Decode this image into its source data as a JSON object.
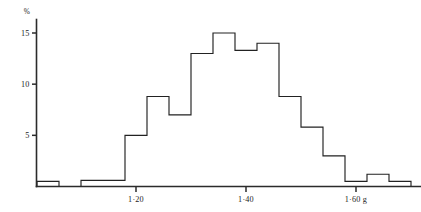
{
  "figure": {
    "name": "weight-distribution-histogram",
    "background_color": "#ffffff",
    "ink_color": "#222222"
  },
  "chart_data": {
    "type": "bar",
    "title": "",
    "subtitle": "",
    "xlabel": "",
    "ylabel": "%",
    "y_unit_label": "%",
    "grid": false,
    "legend": null,
    "ylim": [
      0,
      16.5
    ],
    "xlim": [
      1.02,
      1.72
    ],
    "bin_width": 0.04,
    "y_ticks": [
      5,
      10,
      15
    ],
    "y_tick_labels": [
      "5",
      "10",
      "15"
    ],
    "x_ticks": [
      1.2,
      1.4,
      1.6
    ],
    "x_tick_labels": [
      "1·20",
      "1·40",
      "1·60 g"
    ],
    "x_axis_unit": "g",
    "categories": [
      "1·04",
      "1·08",
      "1·12",
      "1·16",
      "1·20",
      "1·24",
      "1·28",
      "1·32",
      "1·36",
      "1·40",
      "1·44",
      "1·48",
      "1·52",
      "1·56",
      "1·60",
      "1·64",
      "1·68"
    ],
    "values": [
      0.5,
      0.0,
      0.6,
      0.6,
      5.0,
      8.8,
      7.0,
      13.0,
      15.0,
      13.3,
      14.0,
      8.8,
      5.8,
      3.0,
      0.5,
      1.2,
      0.5
    ],
    "series": [
      {
        "name": "frequency",
        "values": [
          0.5,
          0.0,
          0.6,
          0.6,
          5.0,
          8.8,
          7.0,
          13.0,
          15.0,
          13.3,
          14.0,
          8.8,
          5.8,
          3.0,
          0.5,
          1.2,
          0.5
        ]
      }
    ]
  }
}
